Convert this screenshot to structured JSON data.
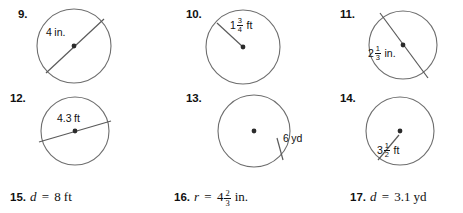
{
  "worksheet": {
    "circle_problems": [
      {
        "number": "9.",
        "measure_kind": "diameter",
        "label_whole": "4",
        "label_fraction": null,
        "unit": "in.",
        "label_text": "4 in.",
        "num_x": 18,
        "num_y": 8,
        "cx": 74,
        "cy": 46,
        "r": 37,
        "line_x1": 46,
        "line_y1": 73,
        "line_x2": 104,
        "line_y2": 19,
        "label_x": 46,
        "label_y": 26
      },
      {
        "number": "10.",
        "measure_kind": "radius",
        "label_whole": "1",
        "label_fraction": {
          "numerator": "3",
          "denominator": "4"
        },
        "unit": "ft",
        "label_text": "1 3/4 ft",
        "num_x": 186,
        "num_y": 8,
        "cx": 243,
        "cy": 47,
        "r": 37,
        "line_x1": 243,
        "line_y1": 47,
        "line_x2": 217,
        "line_y2": 23,
        "label_x": 230,
        "label_y": 17
      },
      {
        "number": "11.",
        "measure_kind": "diameter",
        "label_whole": "2",
        "label_fraction": {
          "numerator": "1",
          "denominator": "3"
        },
        "unit": "in.",
        "label_text": "2 1/3 in.",
        "num_x": 340,
        "num_y": 8,
        "cx": 403,
        "cy": 45,
        "r": 34,
        "line_x1": 380,
        "line_y1": 13,
        "line_x2": 428,
        "line_y2": 78,
        "label_x": 368,
        "label_y": 45
      },
      {
        "number": "12.",
        "measure_kind": "diameter",
        "label_whole": "4.3",
        "label_fraction": null,
        "unit": "ft",
        "label_text": "4.3 ft",
        "num_x": 10,
        "num_y": 92,
        "cx": 75,
        "cy": 131,
        "r": 34,
        "line_x1": 39,
        "line_y1": 142,
        "line_x2": 111,
        "line_y2": 121,
        "label_x": 57,
        "label_y": 112
      },
      {
        "number": "13.",
        "measure_kind": "radius",
        "label_whole": "6",
        "label_fraction": null,
        "unit": "yd",
        "label_text": "6 yd",
        "num_x": 186,
        "num_y": 92,
        "cx": 254,
        "cy": 131,
        "r": 36,
        "line_x1": 277,
        "line_y1": 138,
        "line_x2": 283,
        "line_y2": 160,
        "label_x": 283,
        "label_y": 132
      },
      {
        "number": "14.",
        "measure_kind": "radius",
        "label_whole": "3",
        "label_fraction": {
          "numerator": "1",
          "denominator": "2"
        },
        "unit": "ft",
        "label_text": "3 1/2 ft",
        "num_x": 340,
        "num_y": 92,
        "cx": 400,
        "cy": 131,
        "r": 34,
        "line_x1": 399,
        "line_y1": 135,
        "line_x2": 378,
        "line_y2": 160,
        "label_x": 377,
        "label_y": 142
      }
    ],
    "text_problems": [
      {
        "number": "15.",
        "variable": "d",
        "equals": "=",
        "value_whole": "8",
        "value_fraction": null,
        "unit": "ft",
        "full_text": "d = 8 ft",
        "x": 10,
        "y": 189
      },
      {
        "number": "16.",
        "variable": "r",
        "equals": "=",
        "value_whole": "4",
        "value_fraction": {
          "numerator": "2",
          "denominator": "3"
        },
        "unit": "in.",
        "full_text": "r = 4 2/3 in.",
        "x": 174,
        "y": 189
      },
      {
        "number": "17.",
        "variable": "d",
        "equals": "=",
        "value_whole": "3.1",
        "value_fraction": null,
        "unit": "yd",
        "full_text": "d = 3.1 yd",
        "x": 350,
        "y": 189
      }
    ],
    "colors": {
      "circle_stroke": "#6e6e6e",
      "line_stroke": "#5a5a5a",
      "center_dot": "#2b2b2b",
      "text": "#111111",
      "background": "#ffffff"
    }
  }
}
